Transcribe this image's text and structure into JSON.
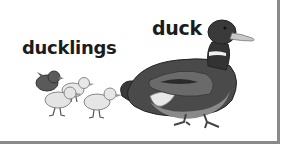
{
  "labels": {
    "ducklings": "ducklings",
    "duck": "duck"
  },
  "illustration": {
    "subjects": [
      "ducklings",
      "duck"
    ],
    "duckling_count": 4,
    "style": "grayscale picture card"
  },
  "colors": {
    "border": "#8a8a8a",
    "text": "#1c1c1c",
    "duck_head": "#3a3a3a",
    "duck_bill": "#c8c8c8",
    "duckling_body": "#e6e6e6",
    "dark_duckling": "#5a5a5a"
  }
}
